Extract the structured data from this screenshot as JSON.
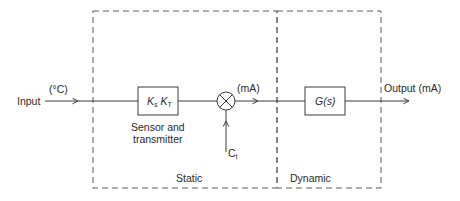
{
  "diagram": {
    "type": "block-diagram",
    "colors": {
      "line": "#3a3a3a",
      "dashed_boundary": "#5a5a5a",
      "text": "#2a2a2a",
      "background": "#ffffff"
    },
    "input": {
      "label": "Input",
      "unit": "(°C)"
    },
    "sensor_block": {
      "gain_main": "K",
      "gain_s_sub": "s",
      "gain_t_main": "K",
      "gain_t_sub": "T",
      "caption_line1": "Sensor and",
      "caption_line2": "transmitter"
    },
    "summing_junction": {
      "output_unit": "(mA)",
      "side_input_main": "C",
      "side_input_sub": "t"
    },
    "dynamic_block": {
      "label_main": "G(",
      "label_var": "s",
      "label_close": ")"
    },
    "output": {
      "label": "Output (mA)"
    },
    "regions": [
      {
        "label": "Static"
      },
      {
        "label": "Dynamic"
      }
    ]
  }
}
